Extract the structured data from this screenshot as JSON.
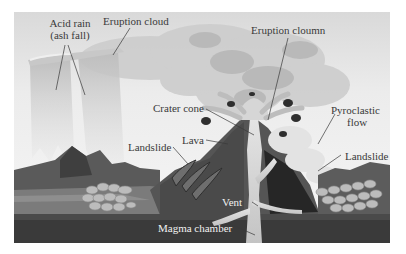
{
  "diagram": {
    "frame": {
      "x": 14,
      "y": 12,
      "width": 376,
      "height": 231
    },
    "colors": {
      "sky_top": "#dcdcdc",
      "sky_bottom": "#f4f4f4",
      "cloud_light": "#d6d6d6",
      "cloud_mid": "#bdbdbd",
      "cloud_dark": "#a3a3a3",
      "mountain_dark": "#4a4a4a",
      "mountain_mid": "#6e6e6e",
      "ground_mid": "#7a7a7a",
      "magma_chamber": "#3a3a3a",
      "vent": "#cfcfcf",
      "rocks": "#b8b8b8",
      "label_text": "#3a3a3a",
      "label_text_light": "#f2f2f2",
      "leader_line": "#3a3a3a"
    },
    "labels": {
      "acid_rain_line1": "Acid rain",
      "acid_rain_line2": "(ash fall)",
      "eruption_cloud": "Eruption cloud",
      "eruption_column": "Eruption cloumn",
      "crater_cone": "Crater cone",
      "pyroclastic_line1": "Pyroclastic",
      "pyroclastic_line2": "flow",
      "lava": "Lava",
      "landslide_left": "Landslide",
      "landslide_right": "Landslide",
      "vent": "Vent",
      "magma_chamber": "Magma chamber"
    }
  }
}
